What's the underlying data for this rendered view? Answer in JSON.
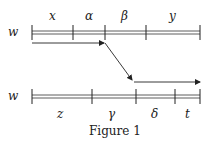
{
  "diagram": {
    "top_row": {
      "var_label": "w",
      "segments": [
        "x",
        "α",
        "β",
        "y"
      ]
    },
    "bottom_row": {
      "var_label": "w",
      "segments": [
        "z",
        "γ",
        "δ",
        "t"
      ]
    },
    "caption": "Figure 1"
  }
}
